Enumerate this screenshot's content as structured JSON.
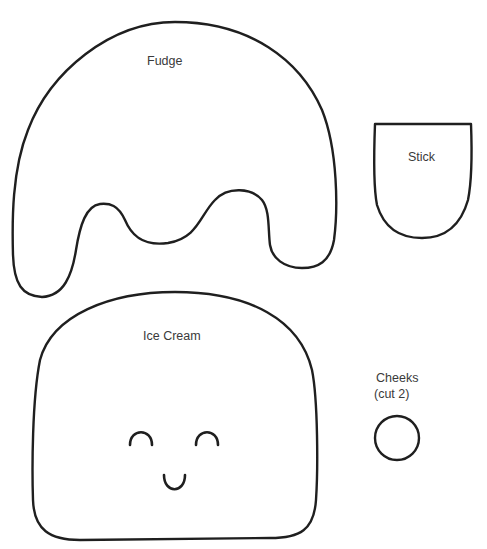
{
  "template": {
    "pieces": [
      {
        "id": "fudge",
        "label": "Fudge"
      },
      {
        "id": "stick",
        "label": "Stick"
      },
      {
        "id": "ice-cream",
        "label": "Ice Cream"
      },
      {
        "id": "cheeks",
        "label_line1": "Cheeks",
        "label_line2": "(cut 2)"
      }
    ],
    "colors": {
      "outline": "#1f1f1f",
      "label_text": "#3a3a3a",
      "background": "#ffffff"
    }
  }
}
